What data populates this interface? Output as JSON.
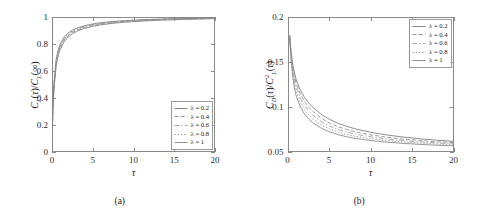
{
  "figure": {
    "panels": [
      {
        "caption": "(a)",
        "xlabel": "τ",
        "ylabel_html": "C<sub>L</sub>(τ)/C<sub>L</sub>(∞)",
        "ylabel_text": "C_L(tau)/C_L(infinity)",
        "xticks": [
          "0",
          "5",
          "10",
          "15",
          "20"
        ],
        "yticks": [
          "0",
          "0.2",
          "0.4",
          "0.6",
          "0.8",
          "1"
        ],
        "legend_position": "bottom-right"
      },
      {
        "caption": "(b)",
        "xlabel": "τ",
        "ylabel_html": "C<sub>D</sub>(τ)/C<sup>2</sup><sub>L</sub>(τ)",
        "ylabel_text": "C_D(tau)/C_L^2(tau)",
        "xticks": [
          "0",
          "5",
          "10",
          "15",
          "20"
        ],
        "yticks": [
          "0.05",
          "0.1",
          "0.15",
          "0.2"
        ],
        "legend_position": "top-right"
      }
    ],
    "legend_entries": [
      {
        "label": "λ = 0.2",
        "style": "solid",
        "color": "#7a7a7a"
      },
      {
        "label": "λ = 0.4",
        "style": "dashed",
        "color": "#8a8a8a"
      },
      {
        "label": "λ = 0.6",
        "style": "dashdot",
        "color": "#9a9a9a"
      },
      {
        "label": "λ = 0.8",
        "style": "dotted",
        "color": "#8f8f8f"
      },
      {
        "label": "λ = 1",
        "style": "solid",
        "color": "#858585"
      }
    ]
  },
  "chart_data": [
    {
      "type": "line",
      "title": "",
      "panel": "(a)",
      "xlabel": "τ",
      "ylabel": "C_L(τ)/C_L(∞)",
      "xlim": [
        0,
        20
      ],
      "ylim": [
        0,
        1
      ],
      "xticks": [
        0,
        5,
        10,
        15,
        20
      ],
      "yticks": [
        0,
        0.2,
        0.4,
        0.6,
        0.8,
        1
      ],
      "grid": false,
      "legend_position": "lower right",
      "x": [
        0,
        0.1,
        0.25,
        0.5,
        0.75,
        1,
        1.5,
        2,
        2.5,
        3,
        4,
        5,
        6,
        7,
        8,
        10,
        12,
        14,
        16,
        18,
        20
      ],
      "series": [
        {
          "name": "λ = 0.2",
          "values": [
            0,
            0.3,
            0.47,
            0.635,
            0.712,
            0.76,
            0.818,
            0.853,
            0.876,
            0.893,
            0.916,
            0.931,
            0.942,
            0.95,
            0.957,
            0.966,
            0.973,
            0.978,
            0.982,
            0.985,
            0.988
          ]
        },
        {
          "name": "λ = 0.4",
          "values": [
            0,
            0.31,
            0.485,
            0.65,
            0.726,
            0.773,
            0.83,
            0.863,
            0.885,
            0.901,
            0.923,
            0.937,
            0.947,
            0.955,
            0.961,
            0.97,
            0.976,
            0.981,
            0.984,
            0.987,
            0.99
          ]
        },
        {
          "name": "λ = 0.6",
          "values": [
            0,
            0.32,
            0.497,
            0.662,
            0.737,
            0.783,
            0.839,
            0.871,
            0.892,
            0.907,
            0.928,
            0.942,
            0.951,
            0.959,
            0.964,
            0.973,
            0.979,
            0.983,
            0.986,
            0.989,
            0.991
          ]
        },
        {
          "name": "λ = 0.8",
          "values": [
            0,
            0.33,
            0.508,
            0.673,
            0.747,
            0.792,
            0.846,
            0.877,
            0.897,
            0.912,
            0.932,
            0.945,
            0.955,
            0.962,
            0.967,
            0.975,
            0.981,
            0.985,
            0.988,
            0.99,
            0.992
          ]
        },
        {
          "name": "λ = 1",
          "values": [
            0,
            0.34,
            0.518,
            0.683,
            0.756,
            0.8,
            0.853,
            0.883,
            0.902,
            0.917,
            0.936,
            0.949,
            0.958,
            0.964,
            0.97,
            0.977,
            0.982,
            0.986,
            0.989,
            0.991,
            0.993
          ]
        }
      ]
    },
    {
      "type": "line",
      "title": "",
      "panel": "(b)",
      "xlabel": "τ",
      "ylabel": "C_D(τ)/C_L^2(τ)",
      "xlim": [
        0,
        20
      ],
      "ylim": [
        0.05,
        0.2
      ],
      "xticks": [
        0,
        5,
        10,
        15,
        20
      ],
      "yticks": [
        0.05,
        0.1,
        0.15,
        0.2
      ],
      "grid": false,
      "legend_position": "upper right",
      "x": [
        0.2,
        0.4,
        0.6,
        0.8,
        1,
        1.5,
        2,
        2.5,
        3,
        4,
        5,
        6,
        7,
        8,
        10,
        12,
        14,
        16,
        18,
        20
      ],
      "series": [
        {
          "name": "λ = 0.2",
          "values": [
            0.18,
            0.159,
            0.146,
            0.137,
            0.13,
            0.1185,
            0.1105,
            0.1045,
            0.0995,
            0.0918,
            0.0862,
            0.082,
            0.0787,
            0.076,
            0.0718,
            0.0688,
            0.0665,
            0.0646,
            0.0631,
            0.0618
          ]
        },
        {
          "name": "λ = 0.4",
          "values": [
            0.179,
            0.157,
            0.143,
            0.133,
            0.126,
            0.1142,
            0.106,
            0.0998,
            0.095,
            0.0876,
            0.0822,
            0.0782,
            0.0752,
            0.0727,
            0.069,
            0.0663,
            0.0643,
            0.0627,
            0.0614,
            0.0603
          ]
        },
        {
          "name": "λ = 0.6",
          "values": [
            0.178,
            0.155,
            0.14,
            0.129,
            0.122,
            0.1098,
            0.1015,
            0.0955,
            0.0908,
            0.0838,
            0.0788,
            0.0751,
            0.0723,
            0.0701,
            0.0668,
            0.0644,
            0.0626,
            0.0612,
            0.06,
            0.0591
          ]
        },
        {
          "name": "λ = 0.8",
          "values": [
            0.177,
            0.152,
            0.136,
            0.125,
            0.117,
            0.105,
            0.0968,
            0.091,
            0.0866,
            0.0801,
            0.0756,
            0.0722,
            0.0697,
            0.0677,
            0.0648,
            0.0627,
            0.0611,
            0.0598,
            0.0588,
            0.058
          ]
        },
        {
          "name": "λ = 1",
          "values": [
            0.176,
            0.149,
            0.132,
            0.12,
            0.112,
            0.1,
            0.092,
            0.0865,
            0.0824,
            0.0765,
            0.0724,
            0.0694,
            0.0671,
            0.0653,
            0.0627,
            0.0609,
            0.0595,
            0.0584,
            0.0575,
            0.0568
          ]
        }
      ]
    }
  ]
}
